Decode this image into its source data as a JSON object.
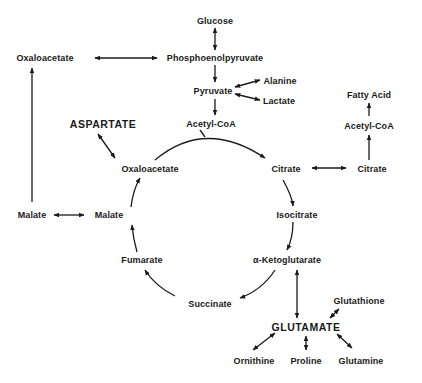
{
  "diagram": {
    "type": "metabolic-pathway",
    "nodes": {
      "glucose": "Glucose",
      "pep": "Phosphoenolpyruvate",
      "oxaloacetate_left": "Oxaloacetate",
      "pyruvate": "Pyruvate",
      "alanine": "Alanine",
      "lactate": "Lactate",
      "acetyl_coa": "Acetyl-CoA",
      "fatty_acid": "Fatty Acid",
      "acetyl_coa_right": "Acetyl-CoA",
      "aspartate": "ASPARTATE",
      "oxaloacetate_cycle": "Oxaloacetate",
      "citrate_cycle": "Citrate",
      "citrate_right": "Citrate",
      "malate_left": "Malate",
      "malate_cycle": "Malate",
      "isocitrate": "Isocitrate",
      "fumarate": "Fumarate",
      "ketoglutarate": "α-Ketoglutarate",
      "succinate": "Succinate",
      "glutathione": "Glutathione",
      "glutamate": "GLUTAMATE",
      "ornithine": "Ornithine",
      "proline": "Proline",
      "glutamine": "Glutamine"
    },
    "edges": [
      {
        "from": "Glucose",
        "to": "Phosphoenolpyruvate",
        "type": "bidirectional"
      },
      {
        "from": "Phosphoenolpyruvate",
        "to": "Oxaloacetate",
        "type": "bidirectional"
      },
      {
        "from": "Phosphoenolpyruvate",
        "to": "Pyruvate",
        "type": "forward"
      },
      {
        "from": "Pyruvate",
        "to": "Alanine",
        "type": "bidirectional"
      },
      {
        "from": "Pyruvate",
        "to": "Lactate",
        "type": "bidirectional"
      },
      {
        "from": "Pyruvate",
        "to": "Acetyl-CoA",
        "type": "forward"
      },
      {
        "from": "Acetyl-CoA",
        "to": "Citrate",
        "type": "forward"
      },
      {
        "from": "Oxaloacetate",
        "to": "Citrate",
        "type": "forward"
      },
      {
        "from": "Citrate",
        "to": "Citrate (cytosol)",
        "type": "bidirectional"
      },
      {
        "from": "Citrate (cytosol)",
        "to": "Acetyl-CoA (cytosol)",
        "type": "forward"
      },
      {
        "from": "Acetyl-CoA (cytosol)",
        "to": "Fatty Acid",
        "type": "forward"
      },
      {
        "from": "Citrate",
        "to": "Isocitrate",
        "type": "forward"
      },
      {
        "from": "Isocitrate",
        "to": "α-Ketoglutarate",
        "type": "forward"
      },
      {
        "from": "α-Ketoglutarate",
        "to": "Succinate",
        "type": "forward"
      },
      {
        "from": "Succinate",
        "to": "Fumarate",
        "type": "forward"
      },
      {
        "from": "Fumarate",
        "to": "Malate",
        "type": "forward"
      },
      {
        "from": "Malate",
        "to": "Oxaloacetate",
        "type": "forward"
      },
      {
        "from": "Oxaloacetate",
        "to": "ASPARTATE",
        "type": "bidirectional"
      },
      {
        "from": "Malate",
        "to": "Malate (cytosol)",
        "type": "bidirectional"
      },
      {
        "from": "Malate (cytosol)",
        "to": "Oxaloacetate (cytosol)",
        "type": "forward"
      },
      {
        "from": "α-Ketoglutarate",
        "to": "GLUTAMATE",
        "type": "bidirectional"
      },
      {
        "from": "Glutathione",
        "to": "GLUTAMATE",
        "type": "bidirectional"
      },
      {
        "from": "GLUTAMATE",
        "to": "Ornithine",
        "type": "bidirectional"
      },
      {
        "from": "GLUTAMATE",
        "to": "Proline",
        "type": "bidirectional"
      },
      {
        "from": "GLUTAMATE",
        "to": "Glutamine",
        "type": "bidirectional"
      }
    ]
  }
}
